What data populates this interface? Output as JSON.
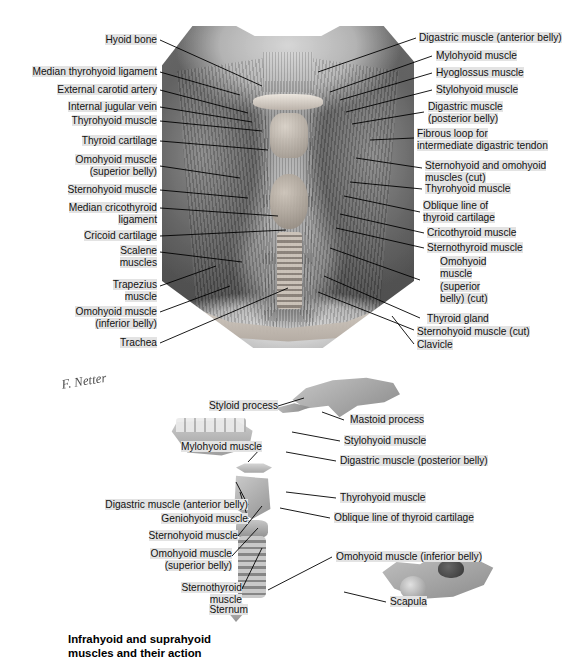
{
  "page": {
    "caption": "Infrahyoid and suprahyoid\nmuscles and their action",
    "signature": "F. Netter",
    "bg_color": "#ffffff",
    "highlight_color": "#e3e3e3"
  },
  "top_figure": {
    "name": "anterior-neck-dissection",
    "labels_left": [
      {
        "id": "hyoid-bone",
        "text": "Hyoid bone"
      },
      {
        "id": "median-thyrohyoid-ligament",
        "text": "Median thyrohyoid ligament"
      },
      {
        "id": "external-carotid-artery",
        "text": "External carotid artery"
      },
      {
        "id": "internal-jugular-vein",
        "text": "Internal jugular vein"
      },
      {
        "id": "thyrohyoid-muscle",
        "text": "Thyrohyoid muscle"
      },
      {
        "id": "thyroid-cartilage",
        "text": "Thyroid cartilage"
      },
      {
        "id": "omohyoid-superior-belly",
        "text": "Omohyoid muscle\n(superior belly)"
      },
      {
        "id": "sternohyoid-muscle",
        "text": "Sternohyoid muscle"
      },
      {
        "id": "median-cricothyroid-ligament",
        "text": "Median cricothyroid\nligament"
      },
      {
        "id": "cricoid-cartilage",
        "text": "Cricoid cartilage"
      },
      {
        "id": "scalene-muscles",
        "text": "Scalene\nmuscles"
      },
      {
        "id": "trapezius-muscle",
        "text": "Trapezius\nmuscle"
      },
      {
        "id": "omohyoid-inferior-belly",
        "text": "Omohyoid muscle\n(inferior belly)"
      },
      {
        "id": "trachea",
        "text": "Trachea"
      }
    ],
    "labels_right": [
      {
        "id": "digastric-anterior-belly",
        "text": "Digastric muscle (anterior belly)"
      },
      {
        "id": "mylohyoid-muscle",
        "text": "Mylohyoid muscle"
      },
      {
        "id": "hyoglossus-muscle",
        "text": "Hyoglossus muscle"
      },
      {
        "id": "stylohyoid-muscle",
        "text": "Stylohyoid muscle"
      },
      {
        "id": "digastric-posterior-belly",
        "text": "Digastric muscle\n(posterior belly)"
      },
      {
        "id": "fibrous-loop",
        "text": "Fibrous loop for\nintermediate digastric tendon"
      },
      {
        "id": "sternohyoid-omohyoid-cut",
        "text": "Sternohyoid and omohyoid\nmuscles (cut)"
      },
      {
        "id": "thyrohyoid-muscle-r",
        "text": "Thyrohyoid muscle"
      },
      {
        "id": "oblique-line-thyroid",
        "text": "Oblique line of\nthyroid cartilage"
      },
      {
        "id": "cricothyroid-muscle",
        "text": "Cricothyroid muscle"
      },
      {
        "id": "sternothyroid-muscle",
        "text": "Sternothyroid muscle"
      },
      {
        "id": "omohyoid-superior-belly-cut",
        "text": "Omohyoid\nmuscle\n(superior\nbelly) (cut)"
      },
      {
        "id": "thyroid-gland",
        "text": "Thyroid gland"
      },
      {
        "id": "sternohyoid-muscle-cut",
        "text": "Sternohyoid muscle (cut)"
      },
      {
        "id": "clavicle",
        "text": "Clavicle"
      }
    ]
  },
  "bottom_figure": {
    "name": "suprahyoid-infrahyoid-action-schematic",
    "labels_left": [
      {
        "id": "styloid-process",
        "text": "Styloid process"
      },
      {
        "id": "mylohyoid-muscle-b",
        "text": "Mylohyoid muscle"
      },
      {
        "id": "digastric-anterior-belly-b",
        "text": "Digastric muscle (anterior belly)"
      },
      {
        "id": "geniohyoid-muscle",
        "text": "Geniohyoid muscle"
      },
      {
        "id": "sternohyoid-muscle-b",
        "text": "Sternohyoid muscle"
      },
      {
        "id": "omohyoid-superior-belly-b",
        "text": "Omohyoid muscle\n(superior belly)"
      },
      {
        "id": "sternothyroid-muscle-b",
        "text": "Sternothyroid\nmuscle"
      },
      {
        "id": "sternum",
        "text": "Sternum"
      }
    ],
    "labels_right": [
      {
        "id": "mastoid-process",
        "text": "Mastoid process"
      },
      {
        "id": "stylohyoid-muscle-b",
        "text": "Stylohyoid muscle"
      },
      {
        "id": "digastric-posterior-belly-b",
        "text": "Digastric muscle (posterior belly)"
      },
      {
        "id": "thyrohyoid-muscle-b",
        "text": "Thyrohyoid muscle"
      },
      {
        "id": "oblique-line-thyroid-b",
        "text": "Oblique line of thyroid cartilage"
      },
      {
        "id": "omohyoid-inferior-belly-b",
        "text": "Omohyoid muscle (inferior belly)"
      },
      {
        "id": "scapula",
        "text": "Scapula"
      }
    ]
  }
}
